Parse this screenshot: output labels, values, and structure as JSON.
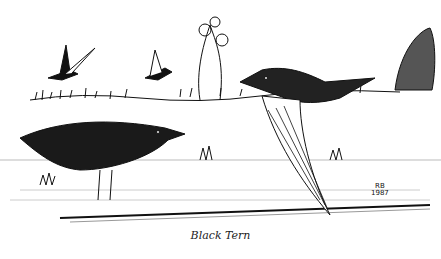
{
  "illustration": {
    "subject": "Black Tern",
    "caption": "Black Tern",
    "signature": {
      "initials": "RB",
      "year": "1987"
    },
    "style": "black ink line drawing on white",
    "colors": {
      "ink": "#111111",
      "paper": "#ffffff"
    }
  }
}
